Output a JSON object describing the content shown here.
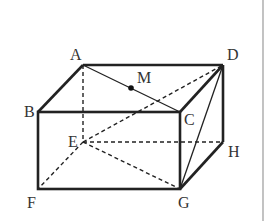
{
  "figure": {
    "type": "rectangular-prism",
    "vertices": {
      "A": {
        "label": "A",
        "x": 83,
        "y": 65,
        "lx": 70,
        "ly": 60
      },
      "B": {
        "label": "B",
        "x": 38,
        "y": 112,
        "lx": 24,
        "ly": 110
      },
      "C": {
        "label": "C",
        "x": 180,
        "y": 112,
        "lx": 184,
        "ly": 123
      },
      "D": {
        "label": "D",
        "x": 223,
        "y": 65,
        "lx": 227,
        "ly": 60
      },
      "E": {
        "label": "E",
        "x": 83,
        "y": 142,
        "lx": 67,
        "ly": 147
      },
      "F": {
        "label": "F",
        "x": 38,
        "y": 189,
        "lx": 26,
        "ly": 208
      },
      "G": {
        "label": "G",
        "x": 180,
        "y": 189,
        "lx": 178,
        "ly": 208
      },
      "H": {
        "label": "H",
        "x": 223,
        "y": 142,
        "lx": 228,
        "ly": 157
      },
      "M": {
        "label": "M",
        "x": 131,
        "y": 88,
        "lx": 137,
        "ly": 83
      }
    },
    "solid_edges": [
      "AB",
      "AD",
      "BC",
      "CD",
      "BF",
      "FG",
      "CG",
      "DH",
      "GH",
      "AC",
      "DG"
    ],
    "dashed_edges": [
      "AE",
      "EF",
      "EH",
      "ED",
      "EG"
    ],
    "points": [
      "M"
    ],
    "colors": {
      "line": "#222222",
      "label": "#333333",
      "border": "#999999"
    }
  }
}
